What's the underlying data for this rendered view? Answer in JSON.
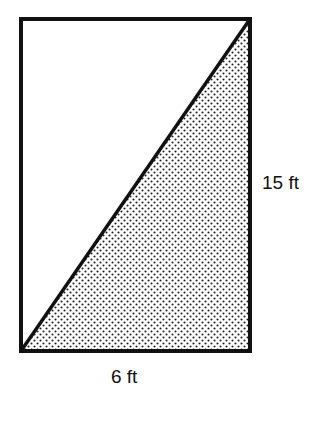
{
  "diagram": {
    "shape": "rectangle divided by a diagonal into two right triangles; lower-right triangle shaded",
    "rectangle": {
      "width_label": "6 ft",
      "height_label": "15 ft"
    },
    "labels": {
      "bottom": "6 ft",
      "right": "15 ft"
    },
    "colors": {
      "stroke": "#111111",
      "shade_dots": "#222222",
      "background": "#ffffff"
    }
  }
}
